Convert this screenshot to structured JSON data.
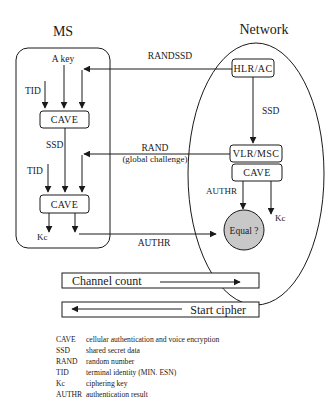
{
  "diagram": {
    "ms": {
      "title": "MS",
      "a_key_label": "A key",
      "tid_label_1": "TID",
      "tid_label_2": "TID",
      "cave_box_1": "CAVE",
      "ssd_label": "SSD",
      "cave_box_2": "CAVE",
      "kc_label": "Kc"
    },
    "network": {
      "title": "Network",
      "hlr_box": "HLR/AC",
      "ssd_label": "SSD",
      "vlr_box": "VLR/MSC",
      "cave_box": "CAVE",
      "authr_label": "AUTHR",
      "kc_label": "Kc",
      "equal_node": "Equal ?"
    },
    "messages": {
      "randssd": "RANDSSD",
      "rand": "RAND",
      "rand_sub": "(global challenge)",
      "authr": "AUTHR"
    },
    "bars": {
      "channel_count": "Channel count",
      "start_cipher": "Start cipher"
    },
    "legend": [
      {
        "abbr": "CAVE",
        "desc": "cellular authentication and voice encryption"
      },
      {
        "abbr": "SSD",
        "desc": "shared secret data"
      },
      {
        "abbr": "RAND",
        "desc": "random number"
      },
      {
        "abbr": "TID",
        "desc": "terminal identity (MIN. ESN)"
      },
      {
        "abbr": "Kc",
        "desc": "ciphering key"
      },
      {
        "abbr": "AUTHR",
        "desc": "authentication result"
      }
    ],
    "colors": {
      "stroke": "#1a1a1a",
      "equal_fill": "#c8c8c8",
      "background": "#ffffff"
    }
  }
}
